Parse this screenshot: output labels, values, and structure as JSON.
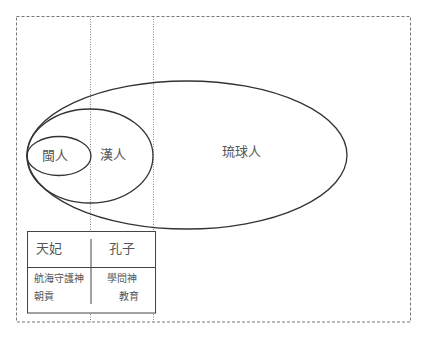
{
  "diagram": {
    "type": "nested-ellipse-venn",
    "colors": {
      "stroke": "#333333",
      "dotted": "#777777",
      "text": "#555555",
      "background": "#ffffff"
    },
    "groups": [
      {
        "id": "min",
        "label": "閩人"
      },
      {
        "id": "han",
        "label": "漢人"
      },
      {
        "id": "ryukyu",
        "label": "琉球人"
      }
    ],
    "table": {
      "headers": [
        "天妃",
        "孔子"
      ],
      "cells": [
        {
          "line1": "航海守護神",
          "line2": "朝貢"
        },
        {
          "line1": "學問神",
          "line2": "教育"
        }
      ]
    }
  }
}
